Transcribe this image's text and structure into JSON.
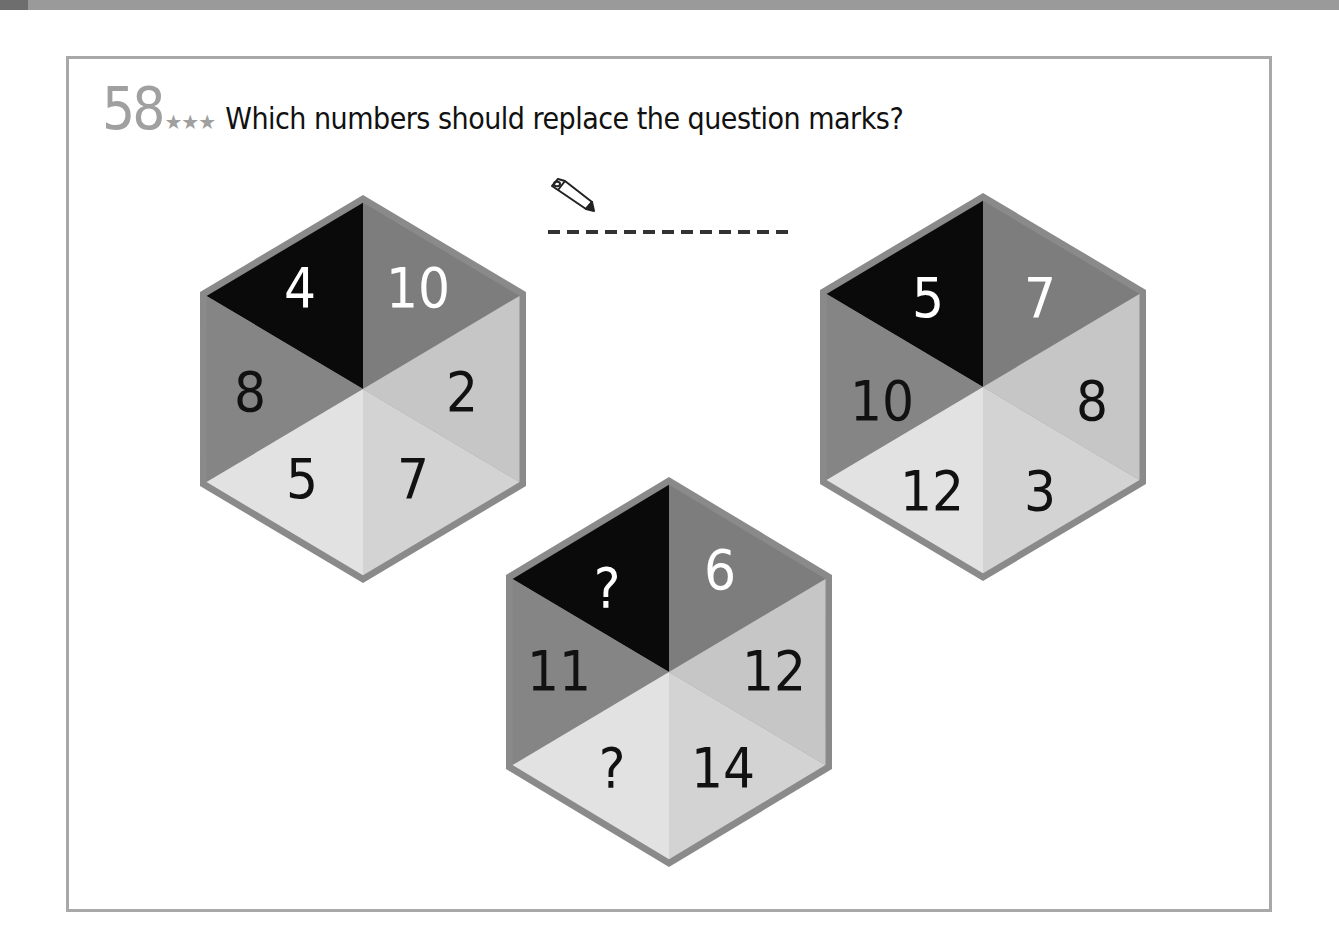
{
  "puzzle": {
    "number": "58",
    "difficulty_stars": "★★★",
    "question": "Which numbers should replace the question marks?",
    "answer_icon": "pencil-icon"
  },
  "colors": {
    "border": "#8a8a8a",
    "top_left": "#0a0a0a",
    "top_right": "#7d7d7d",
    "left": "#858585",
    "right": "#c6c6c6",
    "bottom_left": "#e2e2e2",
    "bottom_right": "#d3d3d3",
    "frame": "#a8a8a8"
  },
  "hexagons": [
    {
      "name": "hexagon-left",
      "top_left": "4",
      "top_right": "10",
      "left": "8",
      "right": "2",
      "bottom_left": "5",
      "bottom_right": "7"
    },
    {
      "name": "hexagon-right",
      "top_left": "5",
      "top_right": "7",
      "left": "10",
      "right": "8",
      "bottom_left": "12",
      "bottom_right": "3"
    },
    {
      "name": "hexagon-bottom",
      "top_left": "?",
      "top_right": "6",
      "left": "11",
      "right": "12",
      "bottom_left": "?",
      "bottom_right": "14"
    }
  ]
}
